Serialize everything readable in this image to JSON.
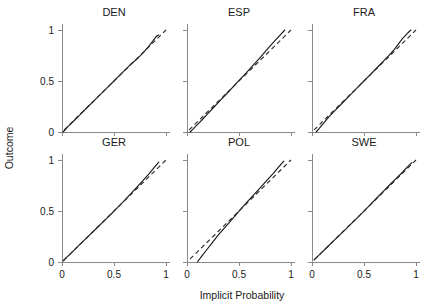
{
  "chart_data": {
    "type": "line",
    "title": "",
    "xlabel": "Implicit Probability",
    "ylabel": "Outcome",
    "xlim": [
      0,
      1
    ],
    "ylim": [
      0,
      1
    ],
    "xticks": [
      0,
      0.5,
      1
    ],
    "yticks": [
      0,
      0.5,
      1
    ],
    "xtick_labels": [
      "0",
      "0.5",
      "1"
    ],
    "ytick_labels": [
      "0",
      "0.5",
      "1"
    ],
    "grid": false,
    "legend": "none",
    "layout": {
      "rows": 2,
      "cols": 3
    },
    "panel_titles": [
      "DEN",
      "ESP",
      "FRA",
      "GER",
      "POL",
      "SWE"
    ],
    "series_names": [
      "Observed outcome",
      "Perfect calibration reference"
    ],
    "panels": [
      {
        "title": "DEN",
        "series": [
          {
            "name": "Observed outcome",
            "style": "solid",
            "x": [
              0.01,
              0.03,
              0.05,
              0.08,
              0.12,
              0.17,
              0.23,
              0.3,
              0.37,
              0.44,
              0.5,
              0.56,
              0.62,
              0.67,
              0.72,
              0.78,
              0.83,
              0.88,
              0.91,
              0.93
            ],
            "y": [
              0.0,
              0.02,
              0.045,
              0.075,
              0.115,
              0.165,
              0.228,
              0.298,
              0.368,
              0.44,
              0.5,
              0.562,
              0.622,
              0.672,
              0.715,
              0.775,
              0.835,
              0.9,
              0.94,
              0.95
            ]
          },
          {
            "name": "Perfect calibration reference",
            "style": "dashed",
            "x": [
              0.02,
              1.0
            ],
            "y": [
              0.02,
              1.0
            ]
          }
        ]
      },
      {
        "title": "ESP",
        "series": [
          {
            "name": "Observed outcome",
            "style": "solid",
            "x": [
              0.03,
              0.06,
              0.1,
              0.15,
              0.2,
              0.26,
              0.32,
              0.39,
              0.45,
              0.51,
              0.57,
              0.63,
              0.69,
              0.75,
              0.8,
              0.85,
              0.9,
              0.94
            ],
            "y": [
              0.0,
              0.03,
              0.072,
              0.125,
              0.18,
              0.245,
              0.31,
              0.385,
              0.45,
              0.515,
              0.58,
              0.648,
              0.715,
              0.785,
              0.845,
              0.9,
              0.955,
              1.0
            ]
          },
          {
            "name": "Perfect calibration reference",
            "style": "dashed",
            "x": [
              0.02,
              1.0
            ],
            "y": [
              0.02,
              1.0
            ]
          }
        ]
      },
      {
        "title": "FRA",
        "series": [
          {
            "name": "Observed outcome",
            "style": "solid",
            "x": [
              0.04,
              0.07,
              0.11,
              0.16,
              0.22,
              0.28,
              0.35,
              0.42,
              0.49,
              0.56,
              0.62,
              0.68,
              0.74,
              0.79,
              0.83,
              0.87,
              0.91,
              0.95
            ],
            "y": [
              0.0,
              0.035,
              0.085,
              0.145,
              0.21,
              0.272,
              0.345,
              0.418,
              0.49,
              0.562,
              0.625,
              0.688,
              0.752,
              0.808,
              0.862,
              0.915,
              0.96,
              1.0
            ]
          },
          {
            "name": "Perfect calibration reference",
            "style": "dashed",
            "x": [
              0.02,
              1.0
            ],
            "y": [
              0.02,
              1.0
            ]
          }
        ]
      },
      {
        "title": "GER",
        "series": [
          {
            "name": "Observed outcome",
            "style": "solid",
            "x": [
              0.01,
              0.03,
              0.06,
              0.1,
              0.15,
              0.21,
              0.27,
              0.34,
              0.41,
              0.48,
              0.54,
              0.6,
              0.66,
              0.72,
              0.78,
              0.84,
              0.89,
              0.93
            ],
            "y": [
              0.01,
              0.03,
              0.06,
              0.1,
              0.15,
              0.21,
              0.268,
              0.338,
              0.408,
              0.478,
              0.54,
              0.602,
              0.668,
              0.735,
              0.8,
              0.868,
              0.93,
              0.98
            ]
          },
          {
            "name": "Perfect calibration reference",
            "style": "dashed",
            "x": [
              0.015,
              1.0
            ],
            "y": [
              0.015,
              1.0
            ]
          }
        ]
      },
      {
        "title": "POL",
        "series": [
          {
            "name": "Observed outcome",
            "style": "solid",
            "x": [
              0.1,
              0.14,
              0.19,
              0.24,
              0.29,
              0.35,
              0.41,
              0.47,
              0.53,
              0.59,
              0.65,
              0.71,
              0.77,
              0.83,
              0.88,
              0.93
            ],
            "y": [
              0.0,
              0.055,
              0.12,
              0.185,
              0.252,
              0.322,
              0.392,
              0.462,
              0.532,
              0.602,
              0.668,
              0.735,
              0.802,
              0.87,
              0.93,
              0.99
            ]
          },
          {
            "name": "Perfect calibration reference",
            "style": "dashed",
            "x": [
              0.03,
              1.0
            ],
            "y": [
              0.03,
              1.0
            ]
          }
        ]
      },
      {
        "title": "SWE",
        "series": [
          {
            "name": "Observed outcome",
            "style": "solid",
            "x": [
              0.02,
              0.05,
              0.09,
              0.14,
              0.2,
              0.26,
              0.32,
              0.39,
              0.45,
              0.51,
              0.57,
              0.63,
              0.69,
              0.75,
              0.81,
              0.87,
              0.92,
              0.96
            ],
            "y": [
              0.02,
              0.05,
              0.09,
              0.14,
              0.2,
              0.258,
              0.318,
              0.388,
              0.448,
              0.508,
              0.572,
              0.635,
              0.698,
              0.76,
              0.82,
              0.88,
              0.935,
              0.975
            ]
          },
          {
            "name": "Perfect calibration reference",
            "style": "dashed",
            "x": [
              0.02,
              1.0
            ],
            "y": [
              0.02,
              1.0
            ]
          }
        ]
      }
    ]
  }
}
